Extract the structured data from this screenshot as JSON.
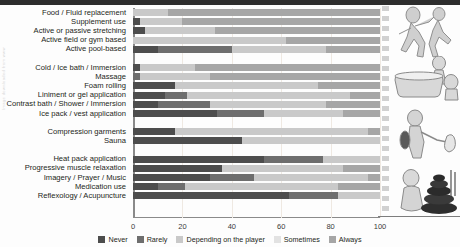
{
  "figure": {
    "watermark_text": "Image downloaded from www",
    "axis": {
      "min": 0,
      "max": 100,
      "ticks": [
        0,
        20,
        40,
        60,
        80,
        100
      ]
    },
    "group_gaps_after": [
      4,
      10,
      12
    ]
  },
  "legend": {
    "items": [
      {
        "label": "Never",
        "color": "#4d4d4d"
      },
      {
        "label": "Rarely",
        "color": "#6e6e6e"
      },
      {
        "label": "Depending on the player",
        "color": "#c9c9c9"
      },
      {
        "label": "Sometimes",
        "color": "#e2e2e2"
      },
      {
        "label": "Always",
        "color": "#a6a6a6"
      }
    ]
  },
  "chart_data": {
    "type": "bar",
    "orientation": "horizontal",
    "stacked": true,
    "percent": true,
    "title": "",
    "xlabel": "",
    "ylabel": "",
    "xlim": [
      0,
      100
    ],
    "grid": true,
    "legend_position": "bottom",
    "legend": [
      "Never",
      "Rarely",
      "Depending on the player",
      "Sometimes",
      "Always"
    ],
    "colors": [
      "#4d4d4d",
      "#6e6e6e",
      "#c9c9c9",
      "#e2e2e2",
      "#a6a6a6"
    ],
    "categories": [
      "Food / Fluid replacement",
      "Supplement use",
      "Active or passive stretching",
      "Active field or gym based",
      "Active pool-based",
      "Cold / Ice bath / Immersion",
      "Massage",
      "Foam rolling",
      "Liniment or gel application",
      "Contrast bath / Shower / Immersion",
      "Ice pack / vest application",
      "Compression garments",
      "Sauna",
      "Heat pack application",
      "Progressive muscle relaxation",
      "Imagery / Prayer / Music",
      "Medication use",
      "Reflexology / Acupuncture"
    ],
    "series": [
      {
        "name": "Never",
        "values": [
          0,
          3,
          5,
          0,
          10,
          3,
          0,
          17,
          13,
          10,
          34,
          17,
          44,
          53,
          36,
          31,
          10,
          63
        ]
      },
      {
        "name": "Rarely",
        "values": [
          0,
          0,
          0,
          0,
          30,
          0,
          3,
          0,
          9,
          21,
          19,
          0,
          0,
          24,
          0,
          18,
          11,
          20
        ]
      },
      {
        "name": "Depending on the player",
        "values": [
          14,
          17,
          28,
          62,
          38,
          22,
          28,
          58,
          66,
          47,
          32,
          78,
          56,
          23,
          49,
          46,
          62,
          17
        ]
      },
      {
        "name": "Sometimes",
        "values": [
          0,
          0,
          0,
          0,
          0,
          0,
          0,
          0,
          0,
          0,
          0,
          0,
          0,
          0,
          0,
          0,
          0,
          0
        ]
      },
      {
        "name": "Always",
        "values": [
          86,
          80,
          67,
          38,
          22,
          75,
          69,
          25,
          12,
          22,
          15,
          5,
          0,
          0,
          15,
          5,
          17,
          0
        ]
      }
    ]
  },
  "illustrations": [
    {
      "name": "running-athlete-illustration"
    },
    {
      "name": "ice-bath-tub-illustration"
    },
    {
      "name": "massage-therapy-illustration"
    },
    {
      "name": "relaxation-stones-illustration"
    }
  ]
}
